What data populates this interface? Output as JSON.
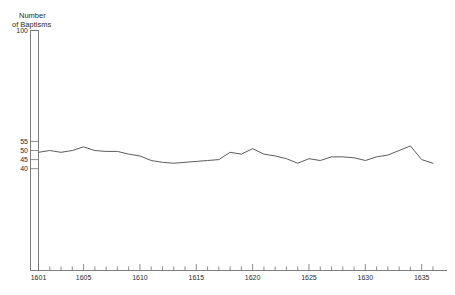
{
  "chart_data": {
    "type": "line",
    "title": "",
    "ylabel": "Number of Baptisms",
    "ylabel_line1": "Number",
    "ylabel_line2": "of Baptisms",
    "xlabel": "",
    "grid": false,
    "legend": "none",
    "line_color": "#4a4a4a",
    "axis_color": "#6f6f6f",
    "ylim": [
      0,
      100
    ],
    "y_ticks": [
      100,
      55,
      50,
      45,
      40
    ],
    "y_tick_labels": [
      "100",
      "55",
      "50",
      "45",
      "40"
    ],
    "y_axis_note": "broken axis: 100 shown at top, detail band 40-55 near baseline",
    "xlim": [
      1600,
      1636
    ],
    "x_ticks": [
      1601,
      1605,
      1610,
      1615,
      1620,
      1625,
      1630,
      1635
    ],
    "x_tick_labels": [
      "1601",
      "1605",
      "1610",
      "1615",
      "1620",
      "1625",
      "1630",
      "1635"
    ],
    "x_minor_tick_step": 1,
    "series": [
      {
        "name": "Number of Baptisms",
        "x": [
          1601,
          1602,
          1603,
          1604,
          1605,
          1606,
          1607,
          1608,
          1609,
          1610,
          1611,
          1612,
          1613,
          1614,
          1615,
          1616,
          1617,
          1618,
          1619,
          1620,
          1621,
          1622,
          1623,
          1624,
          1625,
          1626,
          1627,
          1628,
          1629,
          1630,
          1631,
          1632,
          1633,
          1634,
          1635,
          1636
        ],
        "values": [
          49,
          50,
          49,
          50,
          52,
          50,
          49.5,
          49.5,
          48,
          47,
          44.5,
          43.5,
          43,
          43.5,
          44,
          44.5,
          45,
          49,
          48,
          51,
          48,
          47,
          45.5,
          43,
          45.5,
          44.5,
          46.5,
          46.5,
          46,
          44.5,
          46.5,
          47.5,
          50,
          52.5,
          45,
          43
        ]
      }
    ]
  }
}
